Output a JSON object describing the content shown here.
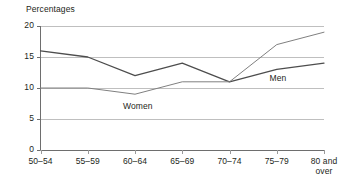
{
  "chart_data": {
    "type": "line",
    "title": "Percentages",
    "xlabel": "",
    "ylabel": "",
    "ylim": [
      0,
      20
    ],
    "yticks": [
      "0",
      "5",
      "10",
      "15",
      "20"
    ],
    "grid": true,
    "legend_position": "inline-annotation",
    "categories": [
      "50–54",
      "55–59",
      "60–64",
      "65–69",
      "70–74",
      "75–79",
      "80 and over"
    ],
    "category_lines": [
      {
        "l1": "50–54",
        "l2": ""
      },
      {
        "l1": "55–59",
        "l2": ""
      },
      {
        "l1": "60–64",
        "l2": ""
      },
      {
        "l1": "65–69",
        "l2": ""
      },
      {
        "l1": "70–74",
        "l2": ""
      },
      {
        "l1": "75–79",
        "l2": ""
      },
      {
        "l1": "80 and",
        "l2": "over"
      }
    ],
    "series": [
      {
        "name": "Men",
        "label": "Men",
        "color": "#4d4d4d",
        "values": [
          16,
          15,
          12,
          14,
          11,
          13,
          14
        ]
      },
      {
        "name": "Women",
        "label": "Women",
        "color": "#808080",
        "values": [
          10,
          10,
          9,
          11,
          11,
          17,
          19
        ]
      }
    ],
    "annotations": [
      {
        "text": "Women",
        "category": "60–64",
        "value": 7.0
      },
      {
        "text": "Men",
        "category": "75–79",
        "value": 11.4
      }
    ]
  },
  "axis": {
    "y_title": "Percentages"
  }
}
